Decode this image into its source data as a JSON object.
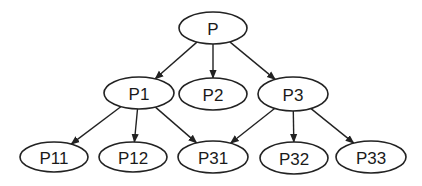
{
  "diagram": {
    "type": "tree",
    "nodes": [
      {
        "id": "P",
        "label": "P",
        "cx": 213,
        "cy": 28,
        "rx": 34,
        "ry": 16
      },
      {
        "id": "P1",
        "label": "P1",
        "cx": 139,
        "cy": 93,
        "rx": 35,
        "ry": 16
      },
      {
        "id": "P2",
        "label": "P2",
        "cx": 213,
        "cy": 94,
        "rx": 34,
        "ry": 16
      },
      {
        "id": "P3",
        "label": "P3",
        "cx": 293,
        "cy": 94,
        "rx": 35,
        "ry": 17
      },
      {
        "id": "P11",
        "label": "P11",
        "cx": 54,
        "cy": 157,
        "rx": 34,
        "ry": 15
      },
      {
        "id": "P12",
        "label": "P12",
        "cx": 133,
        "cy": 157,
        "rx": 34,
        "ry": 15
      },
      {
        "id": "P31",
        "label": "P31",
        "cx": 213,
        "cy": 157,
        "rx": 35,
        "ry": 16
      },
      {
        "id": "P32",
        "label": "P32",
        "cx": 294,
        "cy": 158,
        "rx": 34,
        "ry": 16
      },
      {
        "id": "P33",
        "label": "P33",
        "cx": 371,
        "cy": 157,
        "rx": 35,
        "ry": 16
      }
    ],
    "edges": [
      {
        "from": "P",
        "to": "P1"
      },
      {
        "from": "P",
        "to": "P2"
      },
      {
        "from": "P",
        "to": "P3"
      },
      {
        "from": "P1",
        "to": "P11"
      },
      {
        "from": "P1",
        "to": "P12"
      },
      {
        "from": "P1",
        "to": "P31"
      },
      {
        "from": "P3",
        "to": "P31"
      },
      {
        "from": "P3",
        "to": "P32"
      },
      {
        "from": "P3",
        "to": "P33"
      }
    ],
    "colors": {
      "stroke": "#222222",
      "fill": "#ffffff",
      "text": "#1a1a1a"
    }
  }
}
